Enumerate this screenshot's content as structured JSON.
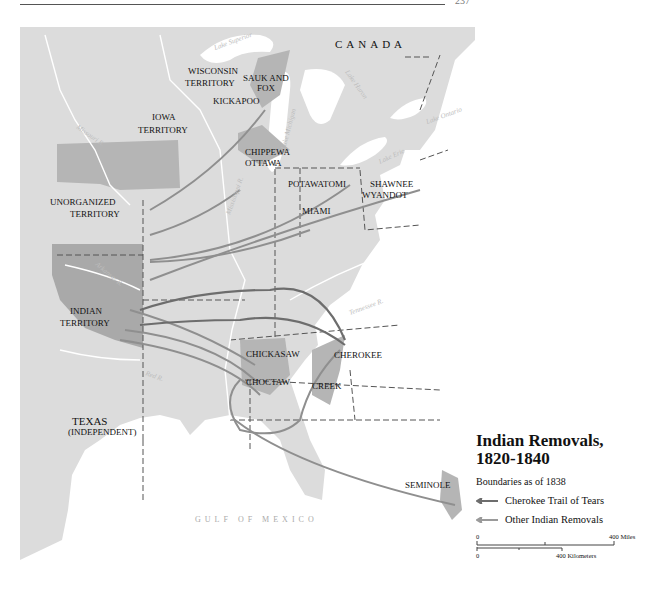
{
  "page": {
    "page_number_fragment": "237"
  },
  "map": {
    "title": "Indian Removals, 1820-1840",
    "title_line1": "Indian Removals,",
    "title_line2": "1820-1840",
    "subtitle": "Boundaries as of 1838",
    "legend": [
      {
        "label": "Cherokee Trail of Tears",
        "color": "#7a7a7a"
      },
      {
        "label": "Other Indian Removals",
        "color": "#9a9a9a"
      }
    ],
    "scale": {
      "miles_zero": "0",
      "miles_label": "400 Miles",
      "km_zero": "0",
      "km_label": "400 Kilometers"
    },
    "regions": {
      "canada": "CANADA",
      "wisconsin1": "WISCONSIN",
      "wisconsin2": "TERRITORY",
      "iowa1": "IOWA",
      "iowa2": "TERRITORY",
      "unorg1": "UNORGANIZED",
      "unorg2": "TERRITORY",
      "indian1": "INDIAN",
      "indian2": "TERRITORY",
      "texas": "TEXAS",
      "texas_note": "(INDEPENDENT)"
    },
    "tribes": {
      "sauk1": "SAUK AND",
      "sauk2": "FOX",
      "kickapoo": "KICKAPOO",
      "chippewa": "CHIPPEWA",
      "ottawa": "OTTAWA",
      "potawatomi": "POTAWATOMI",
      "miami": "MIAMI",
      "shawnee": "SHAWNEE",
      "wyandot": "WYANDOT",
      "chickasaw": "CHICKASAW",
      "choctaw": "CHOCTAW",
      "creek": "CREEK",
      "cherokee": "CHEROKEE",
      "seminole": "SEMINOLE"
    },
    "water": {
      "superior": "Lake Superior",
      "michigan": "Lake Michigan",
      "huron": "Lake Huron",
      "erie": "Lake Erie",
      "ontario": "Lake Ontario",
      "missouri": "Missouri R.",
      "mississippi": "Mississippi R.",
      "arkansas": "Arkansas R.",
      "red": "Red R.",
      "tennessee": "Tennessee R.",
      "atlantic": "ATLANTIC OCEAN",
      "gulf": "GULF OF MEXICO"
    }
  }
}
